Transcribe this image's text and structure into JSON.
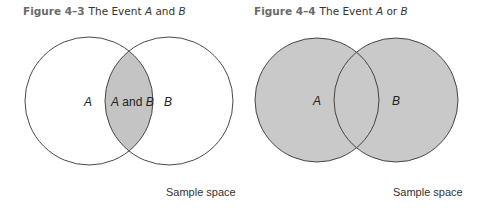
{
  "figures": [
    {
      "number": "Figure 4–3",
      "title_prefix": "The Event ",
      "event_a": "A",
      "connector": " and ",
      "event_b": "B",
      "labels": {
        "a": "A",
        "intersection_a": "A",
        "intersection_and": " and ",
        "intersection_b": "B",
        "b": "B"
      },
      "sample_space": "Sample space",
      "shaded_region": "intersection",
      "shade_color": "#c4c4c4"
    },
    {
      "number": "Figure 4–4",
      "title_prefix": "The Event ",
      "event_a": "A",
      "connector": " or ",
      "event_b": "B",
      "labels": {
        "a": "A",
        "b": "B"
      },
      "sample_space": "Sample space",
      "shaded_region": "union",
      "shade_color": "#c9c9c9"
    }
  ]
}
